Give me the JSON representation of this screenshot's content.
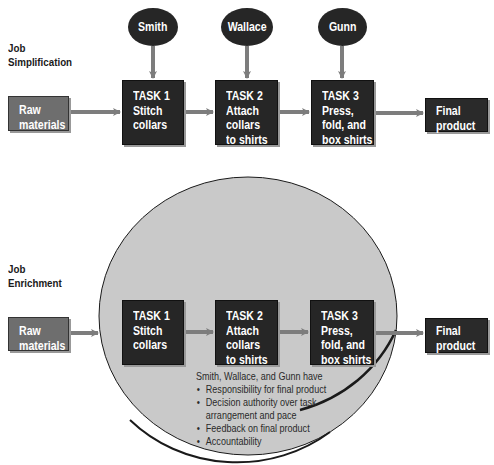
{
  "colors": {
    "raw_box": "#6e6e6e",
    "task_box": "#262626",
    "person_oval": "#262626",
    "arrow": "#7d7d7d",
    "circle_fill": "#c9c9c9",
    "circle_stroke": "#1a1a1a",
    "text_light": "#ffffff",
    "text_dark": "#2a2a2a"
  },
  "simplification": {
    "label": [
      "Job",
      "Simplification"
    ],
    "raw": [
      "Raw",
      "materials"
    ],
    "workers": [
      "Smith",
      "Wallace",
      "Gunn"
    ],
    "tasks": [
      {
        "title": "TASK 1",
        "lines": [
          "Stitch",
          "collars"
        ]
      },
      {
        "title": "TASK 2",
        "lines": [
          "Attach",
          "collars",
          "to shirts"
        ]
      },
      {
        "title": "TASK 3",
        "lines": [
          "Press,",
          "fold, and",
          "box shirts"
        ]
      }
    ],
    "final": [
      "Final",
      "product"
    ]
  },
  "enrichment": {
    "label": [
      "Job",
      "Enrichment"
    ],
    "raw": [
      "Raw",
      "materials"
    ],
    "tasks": [
      {
        "title": "TASK 1",
        "lines": [
          "Stitch",
          "collars"
        ]
      },
      {
        "title": "TASK 2",
        "lines": [
          "Attach",
          "collars",
          "to shirts"
        ]
      },
      {
        "title": "TASK 3",
        "lines": [
          "Press,",
          "fold, and",
          "box shirts"
        ]
      }
    ],
    "final": [
      "Final",
      "product"
    ],
    "intro": "Smith, Wallace, and Gunn have",
    "bullets": [
      [
        "Responsibility for final product"
      ],
      [
        "Decision authority over task",
        "arrangement and pace"
      ],
      [
        "Feedback on final product"
      ],
      [
        "Accountability"
      ]
    ]
  }
}
